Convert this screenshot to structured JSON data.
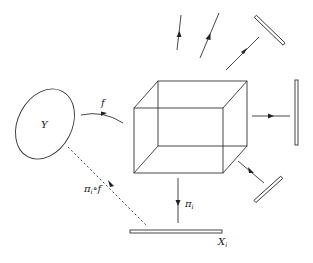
{
  "diagram": {
    "labels": {
      "domain_set": "Y",
      "map": "f",
      "composite_main": "π",
      "composite_sub": "i",
      "composite_tail": "∘f",
      "projection_main": "π",
      "projection_sub": "i",
      "factor_main": "X",
      "factor_sub": "i"
    },
    "nodes": [
      {
        "id": "Y",
        "shape": "ellipse"
      },
      {
        "id": "product",
        "shape": "cube"
      },
      {
        "id": "X_i",
        "shape": "bar"
      },
      {
        "id": "factor-top-right",
        "shape": "bar"
      },
      {
        "id": "factor-right",
        "shape": "bar"
      },
      {
        "id": "factor-bottom-right",
        "shape": "bar"
      }
    ],
    "edges": [
      {
        "from": "Y",
        "to": "product",
        "label": "f",
        "style": "solid"
      },
      {
        "from": "Y",
        "to": "X_i",
        "label": "π_i∘f",
        "style": "dashed"
      },
      {
        "from": "product",
        "to": "X_i",
        "label": "π_i",
        "style": "solid"
      },
      {
        "from": "product",
        "to": "factor-right",
        "style": "solid"
      },
      {
        "from": "product",
        "to": "factor-bottom-right",
        "style": "solid"
      },
      {
        "from": "product",
        "to": "factor-top-right",
        "style": "solid"
      },
      {
        "from": "product",
        "to": "up-1",
        "style": "solid"
      },
      {
        "from": "product",
        "to": "up-2",
        "style": "solid"
      }
    ]
  }
}
